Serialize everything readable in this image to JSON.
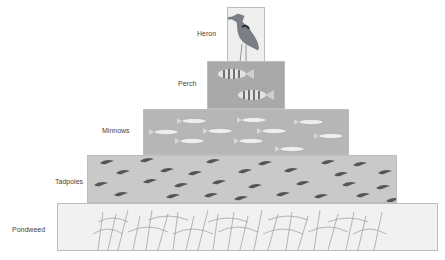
{
  "diagram": {
    "type": "food pyramid",
    "levels": [
      {
        "id": "heron",
        "label": "Heron",
        "organism_icon": "heron-icon",
        "count": 1,
        "fill": "#efefef"
      },
      {
        "id": "perch",
        "label": "Perch",
        "organism_icon": "perch-fish-icon",
        "count": 2,
        "fill": "#a9a9a9"
      },
      {
        "id": "minnows",
        "label": "Minnows",
        "organism_icon": "minnow-fish-icon",
        "count": 10,
        "fill": "#b6b6b6"
      },
      {
        "id": "tadpoles",
        "label": "Tadpoles",
        "organism_icon": "tadpole-icon",
        "count": 40,
        "fill": "#c9c9c9"
      },
      {
        "id": "pondweed",
        "label": "Pondweed",
        "organism_icon": "pondweed-icon",
        "count": 1,
        "fill": "#f1f1f1"
      }
    ]
  }
}
